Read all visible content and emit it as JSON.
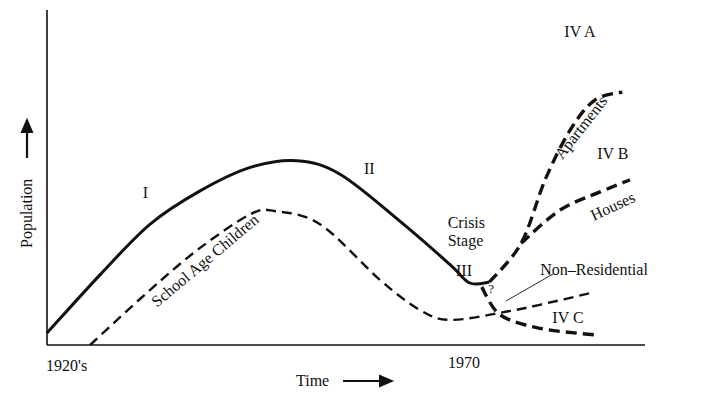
{
  "chart_data": {
    "type": "line",
    "title": "",
    "xlabel": "Time",
    "ylabel": "Population",
    "xlim": [
      0,
      100
    ],
    "ylim": [
      0,
      100
    ],
    "grid": false,
    "legend": "none",
    "x_tick_labels": [
      {
        "x": 0,
        "label": "1920's"
      },
      {
        "x": 72,
        "label": "1970"
      }
    ],
    "series": [
      {
        "name": "Total Population",
        "style": "solid",
        "points": [
          [
            0,
            3.6
          ],
          [
            8.9,
            21
          ],
          [
            17.2,
            36
          ],
          [
            25.6,
            46
          ],
          [
            34,
            53
          ],
          [
            41.8,
            55
          ],
          [
            49,
            51
          ],
          [
            59,
            37
          ],
          [
            67.4,
            24
          ],
          [
            70.7,
            18.5
          ],
          [
            74,
            18.8
          ]
        ]
      },
      {
        "name": "School Age Children",
        "style": "dashed",
        "points": [
          [
            7.2,
            0
          ],
          [
            17.2,
            16.4
          ],
          [
            25.6,
            29
          ],
          [
            34,
            39
          ],
          [
            38,
            40
          ],
          [
            45.7,
            36
          ],
          [
            55.7,
            19.4
          ],
          [
            62.4,
            10.4
          ],
          [
            67.4,
            7.5
          ],
          [
            75.8,
            9.6
          ],
          [
            82.4,
            12
          ],
          [
            91.6,
            15.8
          ]
        ]
      },
      {
        "name": "IV A Apartments",
        "style": "dashed",
        "points": [
          [
            74,
            18.8
          ],
          [
            79.3,
            30.4
          ],
          [
            83.3,
            49.3
          ],
          [
            87.5,
            64.2
          ],
          [
            91.6,
            73.1
          ],
          [
            96.2,
            75.5
          ]
        ]
      },
      {
        "name": "IV B Houses",
        "style": "dashed",
        "points": [
          [
            79.3,
            30.4
          ],
          [
            85.8,
            40.3
          ],
          [
            92.5,
            45.7
          ],
          [
            97.5,
            49.3
          ]
        ]
      },
      {
        "name": "IV C",
        "style": "dashed",
        "points": [
          [
            72.7,
            17.3
          ],
          [
            75.8,
            9
          ],
          [
            82.4,
            5
          ],
          [
            91.6,
            3
          ]
        ]
      }
    ],
    "annotations": [
      {
        "id": "stage-I",
        "text": "I",
        "x": 16,
        "y": 44
      },
      {
        "id": "stage-II",
        "text": "II",
        "x": 53,
        "y": 51
      },
      {
        "id": "crisis-1",
        "text": "Crisis",
        "x": 67,
        "y": 35
      },
      {
        "id": "crisis-2",
        "text": "Stage",
        "x": 67,
        "y": 29.5
      },
      {
        "id": "stage-III",
        "text": "III",
        "x": 68.4,
        "y": 20.5
      },
      {
        "id": "question",
        "text": "?",
        "x": 73.8,
        "y": 15.5
      },
      {
        "id": "non-residential",
        "text": "Non–Residential",
        "x": 82.5,
        "y": 21
      },
      {
        "id": "stage-IVA",
        "text": "IV A",
        "x": 86.5,
        "y": 92
      },
      {
        "id": "stage-IVB",
        "text": "IV B",
        "x": 92,
        "y": 55.5
      },
      {
        "id": "stage-IVC",
        "text": "IV C",
        "x": 84.5,
        "y": 6.5
      },
      {
        "id": "houses",
        "text": "Houses",
        "x": 95,
        "y": 40,
        "rotate": -25
      },
      {
        "id": "apartments",
        "text": "Apartments",
        "x": 90,
        "y": 64,
        "rotate": -52
      },
      {
        "id": "school-age",
        "text": "School Age Children",
        "x": 27,
        "y": 24,
        "rotate": -40
      }
    ]
  }
}
